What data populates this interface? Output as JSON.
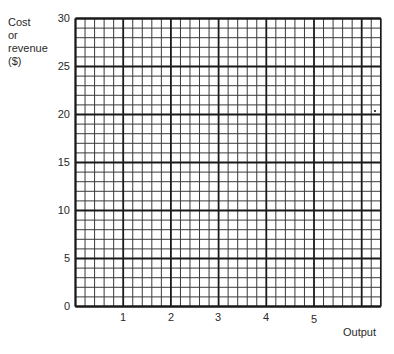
{
  "chart_data": {
    "type": "line",
    "title": "",
    "xlabel": "Output",
    "ylabel": "Cost or revenue ($)",
    "ylabel_lines": [
      "Cost",
      "or",
      "revenue",
      "($)"
    ],
    "x_ticks": [
      "1",
      "2",
      "3",
      "4",
      "5"
    ],
    "y_ticks": [
      "0",
      "5",
      "10",
      "15",
      "20",
      "25",
      "30"
    ],
    "xlim": [
      0,
      6.4
    ],
    "ylim": [
      0,
      30
    ],
    "grid": true,
    "grid_minor_x_per_unit": 5,
    "grid_minor_y_step": 1,
    "grid_major_x_step": 1,
    "grid_major_y_step": 5,
    "series": [],
    "note": "Blank graph-paper axes for plotting cost and revenue against output"
  },
  "colors": {
    "major_line": "#1a1a1a",
    "minor_line": "#3a3a3a",
    "text": "#2a2a2a",
    "background": "#ffffff"
  }
}
